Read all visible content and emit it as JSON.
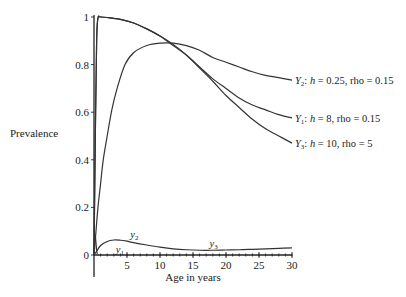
{
  "chart_data": {
    "type": "line",
    "title": "",
    "xlabel": "Age in years",
    "ylabel": "Prevalence",
    "xlim": [
      0,
      30
    ],
    "ylim": [
      0,
      1
    ],
    "x_ticks": [
      5,
      10,
      15,
      20,
      25,
      30
    ],
    "x_tick_labels": [
      "5",
      "10",
      "15",
      "20",
      "25",
      "30"
    ],
    "y_ticks": [
      0,
      0.2,
      0.4,
      0.6,
      0.8,
      1
    ],
    "y_tick_labels": [
      "0",
      "0.2",
      "0.4",
      "0.6",
      "0.8",
      "1"
    ],
    "grid": false,
    "legend": "right-end labels",
    "series": [
      {
        "name": "Y2",
        "label_main": "Y",
        "label_sub": "2",
        "label_rest": ": h = 0.25, rho = 0.15",
        "x": [
          0,
          0.3,
          0.6,
          1.0,
          1.4,
          2.0,
          2.7,
          3.5,
          4.7,
          6,
          8,
          10,
          12,
          14,
          16,
          18,
          20,
          22,
          24,
          26,
          28,
          30
        ],
        "y": [
          0,
          0.1,
          0.2,
          0.3,
          0.4,
          0.5,
          0.61,
          0.7,
          0.8,
          0.85,
          0.88,
          0.89,
          0.89,
          0.88,
          0.86,
          0.83,
          0.81,
          0.79,
          0.77,
          0.755,
          0.745,
          0.735
        ]
      },
      {
        "name": "Y1",
        "label_main": "Y",
        "label_sub": "1",
        "label_rest": ": h = 8, rho = 0.15",
        "x": [
          0,
          0.2,
          0.4,
          0.6,
          1,
          2,
          4,
          6,
          8,
          10,
          12,
          14,
          16,
          18,
          20,
          22,
          24,
          26,
          28,
          30
        ],
        "y": [
          0,
          0.5,
          0.9,
          0.995,
          1.0,
          0.998,
          0.99,
          0.975,
          0.95,
          0.92,
          0.88,
          0.84,
          0.79,
          0.74,
          0.7,
          0.66,
          0.63,
          0.61,
          0.59,
          0.576
        ]
      },
      {
        "name": "Y3",
        "label_main": "Y",
        "label_sub": "3",
        "label_rest": ": h = 10, rho = 5",
        "x": [
          0,
          0.2,
          0.4,
          0.6,
          1,
          2,
          4,
          6,
          8,
          10,
          12,
          14,
          16,
          18,
          20,
          22,
          24,
          26,
          28,
          30
        ],
        "y": [
          0,
          0.5,
          0.9,
          0.995,
          1.0,
          0.998,
          0.99,
          0.975,
          0.95,
          0.92,
          0.885,
          0.84,
          0.785,
          0.73,
          0.67,
          0.62,
          0.57,
          0.53,
          0.5,
          0.47
        ]
      },
      {
        "name": "y1",
        "label_main": "y",
        "label_sub": "1",
        "x": [
          0,
          0.1,
          0.2,
          0.3,
          0.4,
          0.5
        ],
        "y": [
          0,
          0.07,
          0.08,
          0.05,
          0.02,
          0.005
        ]
      },
      {
        "name": "y2/y3",
        "label_main": "y",
        "label_sub": "2",
        "label2_main": "y",
        "label2_sub": "3",
        "x": [
          0,
          0.5,
          1,
          2,
          3,
          4,
          5,
          6,
          8,
          10,
          12,
          14,
          16,
          18,
          20,
          22,
          24,
          26,
          28,
          30
        ],
        "y": [
          0,
          0.02,
          0.04,
          0.057,
          0.063,
          0.062,
          0.058,
          0.052,
          0.042,
          0.033,
          0.026,
          0.022,
          0.02,
          0.02,
          0.021,
          0.022,
          0.024,
          0.026,
          0.028,
          0.03
        ]
      }
    ],
    "annotations": [
      {
        "main": "y",
        "sub": "1",
        "x": 3.3,
        "y": 0.01
      },
      {
        "main": "y",
        "sub": "2",
        "x": 5.5,
        "y": 0.07
      },
      {
        "main": "y",
        "sub": "3",
        "x": 17.5,
        "y": 0.035
      }
    ]
  }
}
